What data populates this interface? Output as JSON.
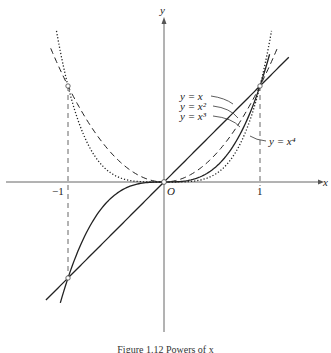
{
  "figure": {
    "caption": "Figure 1.12  Powers of x",
    "axis_x_label": "x",
    "axis_y_label": "y",
    "origin_label": "O",
    "tick_labels": {
      "neg_one": "−1",
      "one": "1"
    },
    "curve_labels": {
      "x1": "y = x",
      "x2": "y = x²",
      "x3": "y = x³",
      "x4": "y = x⁴"
    }
  },
  "chart_data": {
    "type": "line",
    "title": "Powers of x",
    "xlabel": "x",
    "ylabel": "y",
    "xlim": [
      -1.6,
      1.6
    ],
    "ylim": [
      -1.5,
      1.9
    ],
    "grid": false,
    "ticks_x": [
      -1,
      1
    ],
    "reference_lines": [
      "x = -1 (dashed)",
      "x = 1 (dashed)"
    ],
    "series": [
      {
        "name": "y = x",
        "style": "solid",
        "x_range": [
          -1.23,
          1.3
        ]
      },
      {
        "name": "y = x^2",
        "style": "dashed",
        "x_range": [
          -1.18,
          1.18
        ]
      },
      {
        "name": "y = x^3",
        "style": "solid",
        "x_range": [
          -1.08,
          1.1
        ]
      },
      {
        "name": "y = x^4",
        "style": "dotted",
        "x_range": [
          -1.12,
          1.12
        ]
      }
    ],
    "marked_points": [
      [
        0,
        0
      ],
      [
        1,
        1
      ],
      [
        -1,
        1
      ],
      [
        -1,
        -1
      ]
    ]
  }
}
